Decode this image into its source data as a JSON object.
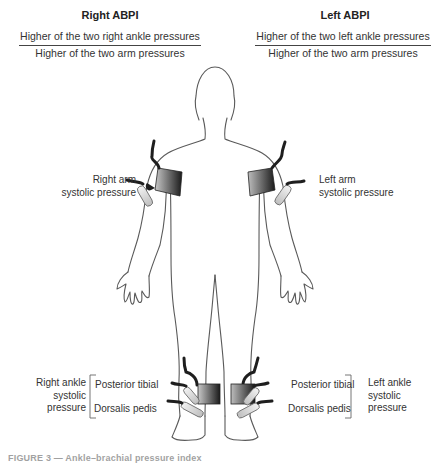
{
  "right_abpi": {
    "title": "Right ABPI",
    "numerator": "Higher of the two right ankle pressures",
    "denominator": "Higher of the two arm pressures"
  },
  "left_abpi": {
    "title": "Left ABPI",
    "numerator": "Higher of the two left ankle pressures",
    "denominator": "Higher of the two arm pressures"
  },
  "labels": {
    "right_arm": [
      "Right arm",
      "systolic pressure"
    ],
    "left_arm": [
      "Left arm",
      "systolic pressure"
    ],
    "right_ankle": [
      "Right ankle",
      "systolic",
      "pressure"
    ],
    "left_ankle": [
      "Left ankle",
      "systolic",
      "pressure"
    ],
    "right_posterior_tibial": "Posterior tibial",
    "right_dorsalis_pedis": "Dorsalis pedis",
    "left_posterior_tibial": "Posterior tibial",
    "left_dorsalis_pedis": "Dorsalis pedis"
  },
  "caption": "FIGURE 3 — Ankle–brachial pressure index",
  "colors": {
    "outline": "#555555",
    "cuff_dark": "#222222",
    "cuff_light": "#bbbbbb",
    "hose": "#1e1e1e",
    "text": "#333333"
  }
}
